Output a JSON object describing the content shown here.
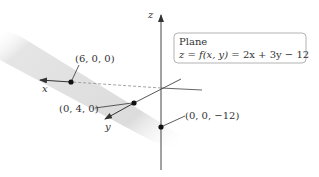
{
  "diagram": {
    "axes": {
      "x_label": "x",
      "y_label": "y",
      "z_label": "z"
    },
    "points": [
      {
        "label": "(6, 0, 0)",
        "coords": [
          6,
          0,
          0
        ]
      },
      {
        "label": "(0, 4, 0)",
        "coords": [
          0,
          4,
          0
        ]
      },
      {
        "label": "(0, 0, −12)",
        "coords": [
          0,
          0,
          -12
        ]
      }
    ],
    "callout": {
      "title": "Plane",
      "equation_lhs": "z = f(x, y)",
      "equation_rhs": " = 2x + 3y − 12"
    },
    "colors": {
      "plane": "#d9d9d9",
      "axis": "#444444",
      "point": "#111111",
      "box_border": "#aaaaaa"
    }
  }
}
